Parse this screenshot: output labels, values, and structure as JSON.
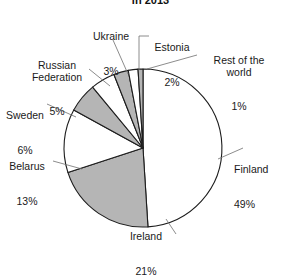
{
  "chart_data": {
    "type": "pie",
    "title": "in 2013",
    "xlabel": "",
    "ylabel": "",
    "legend": "none",
    "grid": false,
    "start_angle_deg": 0,
    "direction": "clockwise",
    "categories": [
      "Finland",
      "Ireland",
      "Belarus",
      "Sweden",
      "Russian Federation",
      "Ukraine",
      "Estonia",
      "Rest of the world"
    ],
    "values": [
      49,
      21,
      13,
      6,
      5,
      3,
      2,
      1
    ],
    "value_unit": "%",
    "slice_fills": [
      "#ffffff",
      "#b5b5b5",
      "#ffffff",
      "#b5b5b5",
      "#ffffff",
      "#b5b5b5",
      "#ffffff",
      "#b5b5b5"
    ],
    "slice_stroke": "#1d1d1d",
    "labels": [
      {
        "name": "Finland",
        "value": "49%"
      },
      {
        "name": "Ireland",
        "value": "21%"
      },
      {
        "name": "Belarus",
        "value": "13%"
      },
      {
        "name": "Sweden",
        "value": "6%"
      },
      {
        "name": "Russian\nFederation",
        "value": "5%"
      },
      {
        "name": "Ukraine",
        "value": "3%"
      },
      {
        "name": "Estonia",
        "value": "2%"
      },
      {
        "name": "Rest of the\nworld",
        "value": "1%"
      }
    ]
  },
  "chart": {
    "title": "in 2013",
    "labels": {
      "finland_name": "Finland",
      "finland_value": "49%",
      "ireland_name": "Ireland",
      "ireland_value": "21%",
      "belarus_name": "Belarus",
      "belarus_value": "13%",
      "sweden_name": "Sweden",
      "sweden_value": "6%",
      "russia_name": "Russian\nFederation",
      "russia_value": "5%",
      "ukraine_name": "Ukraine",
      "ukraine_value": "3%",
      "estonia_name": "Estonia",
      "estonia_value": "2%",
      "rest_name": "Rest of the\nworld",
      "rest_value": "1%"
    }
  }
}
